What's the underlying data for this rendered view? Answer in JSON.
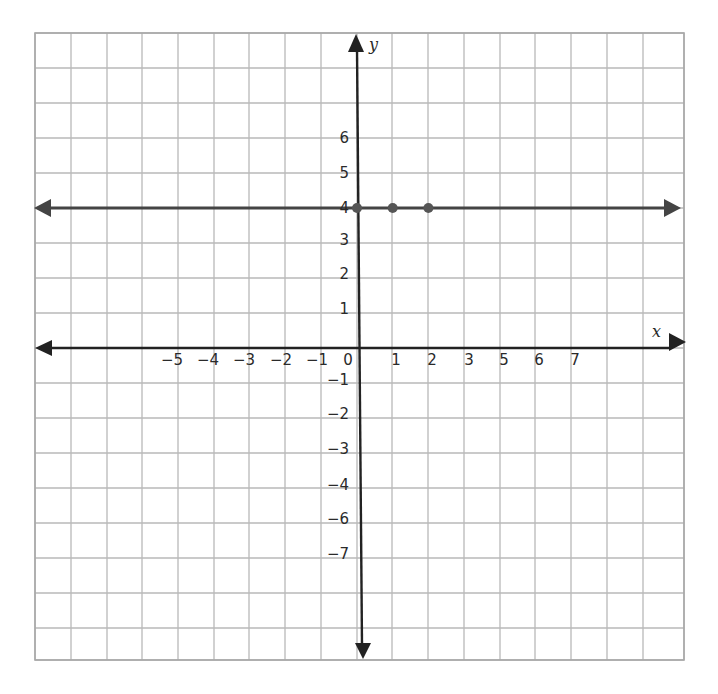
{
  "chart_data": {
    "type": "line",
    "title": "",
    "xlabel": "x",
    "ylabel": "y",
    "grid": true,
    "xlim": [
      -9,
      9
    ],
    "ylim": [
      -9,
      9
    ],
    "x_tick_labels": [
      "-5",
      "-4",
      "-3",
      "-2",
      "-1",
      "0",
      "1",
      "2",
      "3",
      "5",
      "6",
      "7"
    ],
    "y_tick_labels": [
      "6",
      "5",
      "4",
      "3",
      "2",
      "1",
      "-1",
      "-2",
      "-3",
      "-4",
      "-6",
      "-7"
    ],
    "series": [
      {
        "name": "y = 4",
        "kind": "horizontal line with arrows both ends",
        "equation": "y = 4",
        "points": [
          {
            "x": 0,
            "y": 4
          },
          {
            "x": 1,
            "y": 4
          },
          {
            "x": 2,
            "y": 4
          }
        ]
      }
    ],
    "colors": {
      "axis": "#222222",
      "line": "#444444",
      "points": "#555555",
      "grid": "#b8b8b8"
    }
  },
  "labels": {
    "x_axis": "x",
    "y_axis": "y"
  }
}
